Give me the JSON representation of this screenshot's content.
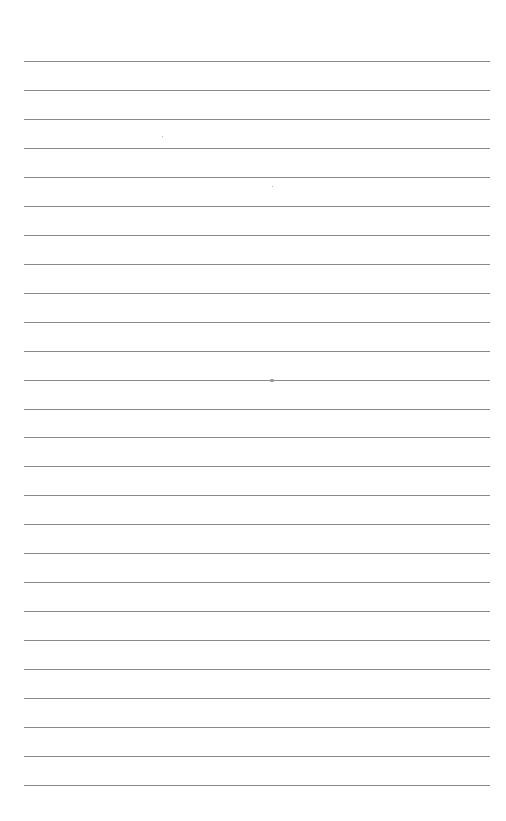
{
  "page": {
    "type": "lined-paper",
    "background": "#ffffff",
    "rule_color": "#8a8a8a",
    "rule_count": 26,
    "first_rule_y": 61,
    "rule_spacing": 28.96,
    "rule_left": 24,
    "rule_right": 490
  },
  "marks": [
    {
      "type": "speck",
      "x": 162,
      "y": 136
    },
    {
      "type": "speck",
      "x": 272,
      "y": 186
    },
    {
      "type": "mark",
      "x": 270,
      "y": 379
    }
  ]
}
